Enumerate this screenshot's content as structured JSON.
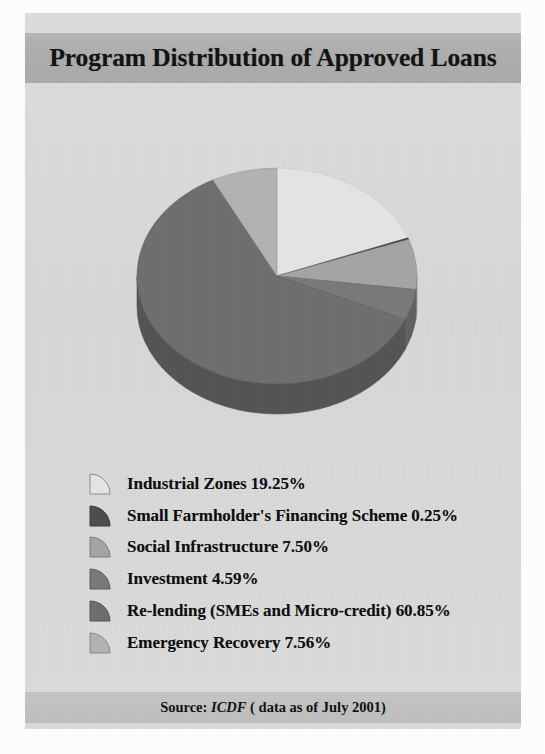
{
  "figure": {
    "title": "Program Distribution of Approved Loans",
    "source_prefix": "Source:",
    "source_name": "ICDF",
    "source_note": "( data as of July 2001)"
  },
  "colors": {
    "card_background": "#dcdcdc",
    "title_bar": "#b0b0b0",
    "footer_bar": "#c2c2c2",
    "title_text": "#141414",
    "legend_text": "#101010",
    "page_background": "#ffffff"
  },
  "chart_data": {
    "type": "pie",
    "title": "Program Distribution of Approved Loans",
    "xlabel": "",
    "ylabel": "",
    "value_unit": "%",
    "three_d": true,
    "start_angle_deg": -90,
    "direction": "clockwise",
    "legend_position": "below",
    "grid": false,
    "categories": [
      "Industrial Zones",
      "Small Farmholder's Financing Scheme",
      "Social Infrastructure",
      "Investment",
      "Re-lending (SMEs and Micro-credit)",
      "Emergency Recovery"
    ],
    "values": [
      19.25,
      0.25,
      7.5,
      4.59,
      60.85,
      7.56
    ],
    "total": 100.0,
    "slices": [
      {
        "label": "Industrial Zones",
        "value": 19.25,
        "value_text": "19.25%",
        "legend_text": "Industrial Zones 19.25%",
        "color": "#e6e6e6",
        "side_color": "#c2c2c2"
      },
      {
        "label": "Small Farmholder's Financing Scheme",
        "value": 0.25,
        "value_text": "0.25%",
        "legend_text": "Small Farmholder's Financing Scheme 0.25%",
        "color": "#4f4f4f",
        "side_color": "#3b3b3b"
      },
      {
        "label": "Social Infrastructure",
        "value": 7.5,
        "value_text": "7.50%",
        "legend_text": "Social Infrastructure 7.50%",
        "color": "#a6a6a6",
        "side_color": "#8a8a8a"
      },
      {
        "label": "Investment",
        "value": 4.59,
        "value_text": "4.59%",
        "legend_text": "Investment 4.59%",
        "color": "#7b7b7b",
        "side_color": "#626262"
      },
      {
        "label": "Re-lending (SMEs and Micro-credit)",
        "value": 60.85,
        "value_text": "60.85%",
        "legend_text": "Re-lending (SMEs and Micro-credit) 60.85%",
        "color": "#707070",
        "side_color": "#565656"
      },
      {
        "label": "Emergency Recovery",
        "value": 7.56,
        "value_text": "7.56%",
        "legend_text": "Emergency Recovery 7.56%",
        "color": "#b4b4b4",
        "side_color": "#969696"
      }
    ]
  },
  "legend": {
    "items": [
      {
        "label": "Industrial Zones 19.25%",
        "color": "#e6e6e6"
      },
      {
        "label": "Small Farmholder's Financing Scheme 0.25%",
        "color": "#4f4f4f"
      },
      {
        "label": "Social Infrastructure 7.50%",
        "color": "#a6a6a6"
      },
      {
        "label": "Investment 4.59%",
        "color": "#7b7b7b"
      },
      {
        "label": "Re-lending (SMEs and Micro-credit) 60.85%",
        "color": "#707070"
      },
      {
        "label": "Emergency Recovery 7.56%",
        "color": "#b4b4b4"
      }
    ]
  }
}
